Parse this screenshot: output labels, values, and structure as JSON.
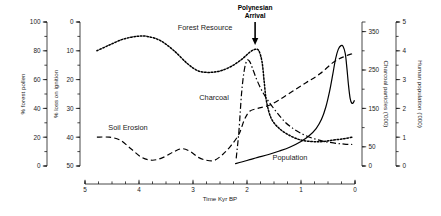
{
  "chart_data": {
    "type": "line",
    "title": "",
    "xlabel": "Time Kyr BP",
    "xlim": [
      5,
      0
    ],
    "x_reversed": true,
    "x_ticks": [
      5,
      4,
      3,
      2,
      1,
      0
    ],
    "x_minor_step": 0.25,
    "grid": false,
    "legend": "inline-labels",
    "annotations": [
      {
        "text_line1": "Polynesian",
        "text_line2": "Arrival",
        "x": 1.85,
        "marker": "down-arrow"
      }
    ],
    "axes": [
      {
        "id": "forest_pollen",
        "label": "% forest pollen",
        "side": "left",
        "position": 1,
        "ticks": [
          100,
          80,
          60,
          40,
          20,
          0
        ],
        "lim": [
          0,
          100
        ],
        "inverted": false,
        "minor_step": 10
      },
      {
        "id": "loss_on_ignition",
        "label": "% loss on ignition",
        "side": "left",
        "position": 2,
        "ticks": [
          0,
          10,
          20,
          30,
          40,
          50
        ],
        "lim": [
          0,
          50
        ],
        "inverted": true,
        "minor_step": 5
      },
      {
        "id": "charcoal_particles",
        "label": "Charcoal particles ('000)",
        "side": "right",
        "position": 1,
        "ticks": [
          350,
          250,
          150,
          50,
          0
        ],
        "lim": [
          0,
          375
        ],
        "inverted": false,
        "minor_step": 50
      },
      {
        "id": "human_population",
        "label": "Human population ('000)",
        "side": "right",
        "position": 2,
        "ticks": [
          5,
          4,
          3,
          2,
          1,
          0
        ],
        "lim": [
          0,
          5
        ],
        "inverted": false,
        "minor_step": 0.5
      }
    ],
    "series": [
      {
        "name": "Forest Resource",
        "axis": "forest_pollen",
        "style": "dotted",
        "label_x": 3.35,
        "points": [
          {
            "x": 4.78,
            "y": 80
          },
          {
            "x": 4.55,
            "y": 84
          },
          {
            "x": 4.3,
            "y": 88
          },
          {
            "x": 4.05,
            "y": 90
          },
          {
            "x": 3.85,
            "y": 90
          },
          {
            "x": 3.6,
            "y": 87
          },
          {
            "x": 3.35,
            "y": 80
          },
          {
            "x": 3.1,
            "y": 71
          },
          {
            "x": 2.9,
            "y": 66
          },
          {
            "x": 2.7,
            "y": 65
          },
          {
            "x": 2.5,
            "y": 66
          },
          {
            "x": 2.3,
            "y": 69
          },
          {
            "x": 2.1,
            "y": 74
          },
          {
            "x": 1.95,
            "y": 79
          },
          {
            "x": 1.85,
            "y": 81
          },
          {
            "x": 1.78,
            "y": 80
          },
          {
            "x": 1.72,
            "y": 72
          },
          {
            "x": 1.68,
            "y": 58
          },
          {
            "x": 1.64,
            "y": 45
          },
          {
            "x": 1.55,
            "y": 33
          },
          {
            "x": 1.4,
            "y": 26
          },
          {
            "x": 1.2,
            "y": 21
          },
          {
            "x": 1.0,
            "y": 18
          },
          {
            "x": 0.8,
            "y": 17
          },
          {
            "x": 0.6,
            "y": 17
          },
          {
            "x": 0.4,
            "y": 18
          },
          {
            "x": 0.2,
            "y": 19
          },
          {
            "x": 0.05,
            "y": 20
          }
        ]
      },
      {
        "name": "Soil Erosion",
        "axis": "loss_on_ignition",
        "style": "dashed",
        "label_x": 4.1,
        "points": [
          {
            "x": 4.78,
            "y": 40
          },
          {
            "x": 4.55,
            "y": 40
          },
          {
            "x": 4.35,
            "y": 41
          },
          {
            "x": 4.15,
            "y": 44
          },
          {
            "x": 3.95,
            "y": 47
          },
          {
            "x": 3.75,
            "y": 48
          },
          {
            "x": 3.55,
            "y": 47
          },
          {
            "x": 3.35,
            "y": 45
          },
          {
            "x": 3.2,
            "y": 44
          },
          {
            "x": 3.05,
            "y": 45
          },
          {
            "x": 2.9,
            "y": 47
          },
          {
            "x": 2.75,
            "y": 48
          },
          {
            "x": 2.6,
            "y": 48
          },
          {
            "x": 2.45,
            "y": 46
          },
          {
            "x": 2.3,
            "y": 43
          },
          {
            "x": 2.15,
            "y": 39
          },
          {
            "x": 2.05,
            "y": 34
          },
          {
            "x": 1.95,
            "y": 31
          },
          {
            "x": 1.8,
            "y": 30
          },
          {
            "x": 1.6,
            "y": 29
          },
          {
            "x": 1.4,
            "y": 27
          },
          {
            "x": 1.15,
            "y": 24
          },
          {
            "x": 0.9,
            "y": 21
          },
          {
            "x": 0.65,
            "y": 18
          },
          {
            "x": 0.4,
            "y": 14
          },
          {
            "x": 0.2,
            "y": 12
          },
          {
            "x": 0.05,
            "y": 11
          }
        ]
      },
      {
        "name": "Charcoal",
        "axis": "charcoal_particles",
        "style": "dash-dot",
        "label_x": 2.35,
        "points": [
          {
            "x": 2.2,
            "y": 20
          },
          {
            "x": 2.15,
            "y": 90
          },
          {
            "x": 2.1,
            "y": 190
          },
          {
            "x": 2.05,
            "y": 250
          },
          {
            "x": 2.0,
            "y": 275
          },
          {
            "x": 1.95,
            "y": 272
          },
          {
            "x": 1.9,
            "y": 255
          },
          {
            "x": 1.82,
            "y": 225
          },
          {
            "x": 1.72,
            "y": 195
          },
          {
            "x": 1.6,
            "y": 168
          },
          {
            "x": 1.45,
            "y": 140
          },
          {
            "x": 1.3,
            "y": 115
          },
          {
            "x": 1.15,
            "y": 98
          },
          {
            "x": 1.0,
            "y": 85
          },
          {
            "x": 0.8,
            "y": 73
          },
          {
            "x": 0.6,
            "y": 65
          },
          {
            "x": 0.4,
            "y": 60
          },
          {
            "x": 0.2,
            "y": 57
          },
          {
            "x": 0.05,
            "y": 56
          }
        ]
      },
      {
        "name": "Population",
        "axis": "human_population",
        "style": "solid",
        "label_x": 0.9,
        "points": [
          {
            "x": 2.22,
            "y": 0.08
          },
          {
            "x": 2.1,
            "y": 0.14
          },
          {
            "x": 1.95,
            "y": 0.22
          },
          {
            "x": 1.8,
            "y": 0.3
          },
          {
            "x": 1.6,
            "y": 0.4
          },
          {
            "x": 1.4,
            "y": 0.52
          },
          {
            "x": 1.2,
            "y": 0.66
          },
          {
            "x": 1.0,
            "y": 0.85
          },
          {
            "x": 0.85,
            "y": 1.05
          },
          {
            "x": 0.72,
            "y": 1.3
          },
          {
            "x": 0.62,
            "y": 1.62
          },
          {
            "x": 0.54,
            "y": 2.05
          },
          {
            "x": 0.47,
            "y": 2.6
          },
          {
            "x": 0.41,
            "y": 3.2
          },
          {
            "x": 0.36,
            "y": 3.72
          },
          {
            "x": 0.31,
            "y": 4.05
          },
          {
            "x": 0.26,
            "y": 4.18
          },
          {
            "x": 0.22,
            "y": 4.15
          },
          {
            "x": 0.18,
            "y": 3.9
          },
          {
            "x": 0.15,
            "y": 3.4
          },
          {
            "x": 0.12,
            "y": 2.8
          },
          {
            "x": 0.09,
            "y": 2.35
          },
          {
            "x": 0.06,
            "y": 2.18
          },
          {
            "x": 0.03,
            "y": 2.2
          },
          {
            "x": 0.01,
            "y": 2.28
          }
        ]
      }
    ]
  }
}
